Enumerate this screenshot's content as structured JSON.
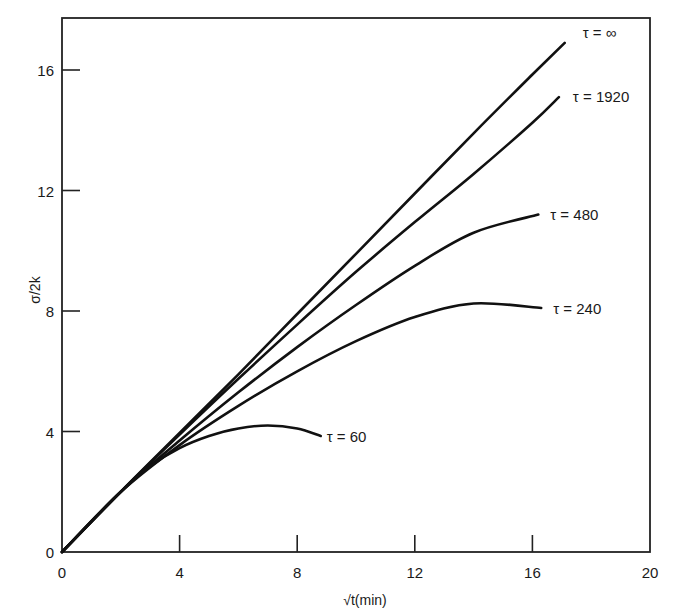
{
  "chart_data": {
    "type": "line",
    "title": "",
    "xlabel": "√t(min)",
    "ylabel": "σ/2k",
    "xlim": [
      0,
      20
    ],
    "ylim": [
      0,
      17.8
    ],
    "xticks": [
      0,
      4,
      8,
      12,
      16,
      20
    ],
    "xtick_labels": [
      "0",
      "4",
      "8",
      "12",
      "16",
      "20"
    ],
    "yticks": [
      0,
      4,
      8,
      12,
      16
    ],
    "ytick_labels": [
      "0",
      "4",
      "8",
      "12",
      "16"
    ],
    "grid": false,
    "legend": "inline labels at curve ends",
    "series": [
      {
        "name": "τ = ∞",
        "label": "τ = ∞",
        "x": [
          0,
          2,
          4,
          6,
          8,
          10,
          12,
          14,
          16,
          17.1
        ],
        "y": [
          0,
          2.0,
          3.95,
          5.9,
          7.9,
          9.9,
          11.9,
          13.9,
          15.85,
          16.9
        ]
      },
      {
        "name": "τ = 1920",
        "label": "τ = 1920",
        "x": [
          0,
          2,
          4,
          6,
          8,
          10,
          12,
          14,
          16,
          16.9
        ],
        "y": [
          0,
          2.0,
          3.9,
          5.75,
          7.55,
          9.3,
          10.95,
          12.55,
          14.25,
          15.1
        ]
      },
      {
        "name": "τ = 480",
        "label": "τ = 480",
        "x": [
          0,
          2,
          4,
          6,
          8,
          10,
          12,
          14,
          16.2
        ],
        "y": [
          0,
          2.0,
          3.7,
          5.3,
          6.8,
          8.2,
          9.5,
          10.6,
          11.2
        ]
      },
      {
        "name": "τ = 240",
        "label": "τ = 240",
        "x": [
          0,
          2,
          4,
          6,
          8,
          10,
          12,
          14,
          16.3
        ],
        "y": [
          0,
          2.0,
          3.55,
          4.85,
          6.0,
          7.0,
          7.8,
          8.25,
          8.1
        ]
      },
      {
        "name": "τ = 60",
        "label": "τ = 60",
        "x": [
          0,
          2,
          3,
          4,
          5,
          6,
          7,
          8,
          8.8
        ],
        "y": [
          0,
          2.0,
          2.85,
          3.45,
          3.85,
          4.1,
          4.2,
          4.1,
          3.85
        ]
      }
    ]
  }
}
